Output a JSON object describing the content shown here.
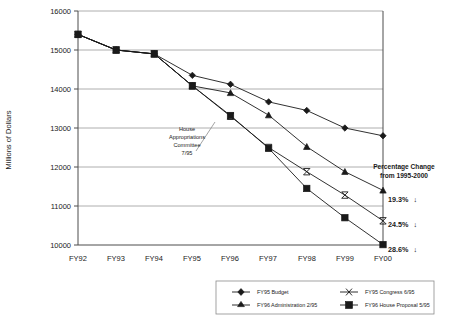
{
  "chart_data": {
    "type": "line",
    "title": "",
    "xlabel": "",
    "ylabel": "Millions of Dollars",
    "categories": [
      "FY92",
      "FY93",
      "FY94",
      "FY95",
      "FY96",
      "FY97",
      "FY98",
      "FY99",
      "FY00"
    ],
    "ylim": [
      10000,
      16000
    ],
    "ytick_values": [
      10000,
      11000,
      12000,
      13000,
      14000,
      15000,
      16000
    ],
    "ytick_labels": [
      "10000",
      "11000",
      "12000",
      "13000",
      "14000",
      "15000",
      "16000"
    ],
    "grid": true,
    "legend_position": "bottom",
    "series": [
      {
        "name": "FY95 Budget",
        "marker": "diamond",
        "values": [
          15400,
          15000,
          14900,
          14350,
          14120,
          13670,
          13450,
          13000,
          12800
        ]
      },
      {
        "name": "FY95 Congress 6/95",
        "marker": "cross",
        "values": [
          15400,
          15000,
          14900,
          14080,
          13300,
          12500,
          11880,
          11280,
          10620
        ]
      },
      {
        "name": "FY96 Administration 2/95",
        "marker": "triangle",
        "values": [
          15400,
          15000,
          14900,
          14080,
          13900,
          13330,
          12520,
          11880,
          11400
        ]
      },
      {
        "name": "FY96 House Proposal 5/95",
        "marker": "square",
        "values": [
          15400,
          15000,
          14900,
          14080,
          13320,
          12480,
          11450,
          10700,
          10010
        ]
      }
    ],
    "annotations": [
      {
        "name": "house-appropriations-callout",
        "lines": [
          "House",
          "Appropriations",
          "Committee",
          "7/95"
        ]
      }
    ],
    "percentage_panel": {
      "header_line1": "Percentage Change",
      "header_line2": "from 1995-2000",
      "entries": [
        {
          "value": "19.3%",
          "arrow": "↓"
        },
        {
          "value": "24.5%",
          "arrow": "↓"
        },
        {
          "value": "28.6%",
          "arrow": "↓"
        }
      ]
    }
  }
}
